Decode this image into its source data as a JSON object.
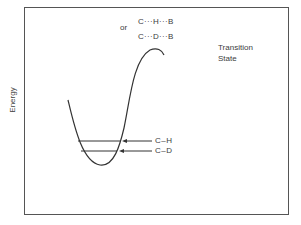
{
  "diagram": {
    "y_axis_label": "Energy",
    "transition_state_label": {
      "line1": "Transition",
      "line2": "State"
    },
    "transition_species": {
      "prefix": "or",
      "ch_species": "C···H···B",
      "cd_species": "C···D···B"
    },
    "energy_levels": [
      {
        "label": "C–H",
        "y": 141
      },
      {
        "label": "C–D",
        "y": 151
      }
    ],
    "colors": {
      "line": "#333333",
      "frame": "#555555",
      "text": "#3c3c3c",
      "background": "#ffffff"
    }
  }
}
